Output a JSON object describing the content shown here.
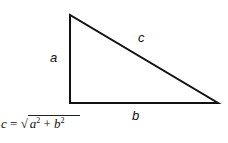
{
  "diagram": {
    "sides": {
      "a": {
        "label": "a",
        "from": [
          70,
          15
        ],
        "to": [
          70,
          103
        ]
      },
      "b": {
        "label": "b",
        "from": [
          70,
          103
        ],
        "to": [
          218,
          103
        ]
      },
      "c": {
        "label": "c",
        "from": [
          70,
          15
        ],
        "to": [
          218,
          103
        ]
      }
    },
    "formula": {
      "lhs": "c",
      "eq": "=",
      "radical": "√",
      "a": "a",
      "exp_a": "2",
      "plus": "+",
      "b": "b",
      "exp_b": "2"
    },
    "colors": {
      "stroke": "#111111",
      "background": "#ffffff"
    }
  }
}
